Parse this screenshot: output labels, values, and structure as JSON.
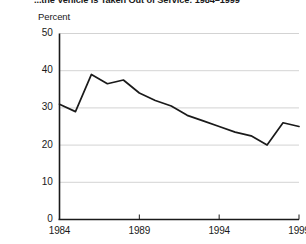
{
  "chart_data": {
    "type": "line",
    "title": "...the Vehicle is Taken Out of Service: 1984–1999",
    "ylabel": "Percent",
    "xlabel": "",
    "grid": true,
    "legend": false,
    "ylim": [
      0,
      50
    ],
    "xlim": [
      1984,
      1999
    ],
    "yticks": [
      0,
      10,
      20,
      30,
      40,
      50
    ],
    "ytick_labels": [
      "0",
      "10",
      "20",
      "30",
      "40",
      "50"
    ],
    "xticks": [
      1984,
      1989,
      1994,
      1999
    ],
    "xtick_labels": [
      "1984",
      "1989",
      "1994",
      "1999"
    ],
    "x": [
      1984,
      1985,
      1986,
      1987,
      1988,
      1989,
      1990,
      1991,
      1992,
      1993,
      1994,
      1995,
      1996,
      1997,
      1998,
      1999
    ],
    "values": [
      31,
      29,
      39,
      36.5,
      37.5,
      34,
      32,
      30.5,
      28,
      26.5,
      25,
      23.5,
      22.5,
      20,
      26,
      25
    ],
    "series": [
      {
        "name": "Percent",
        "color": "#1a1a1a",
        "values": [
          31,
          29,
          39,
          36.5,
          37.5,
          34,
          32,
          30.5,
          28,
          26.5,
          25,
          23.5,
          22.5,
          20,
          26,
          25
        ]
      }
    ]
  },
  "colors": {
    "line": "#1a1a1a",
    "axis": "#1a1a1a",
    "grid": "#c8c8c8",
    "background": "#ffffff",
    "text": "#1a1a1a"
  }
}
